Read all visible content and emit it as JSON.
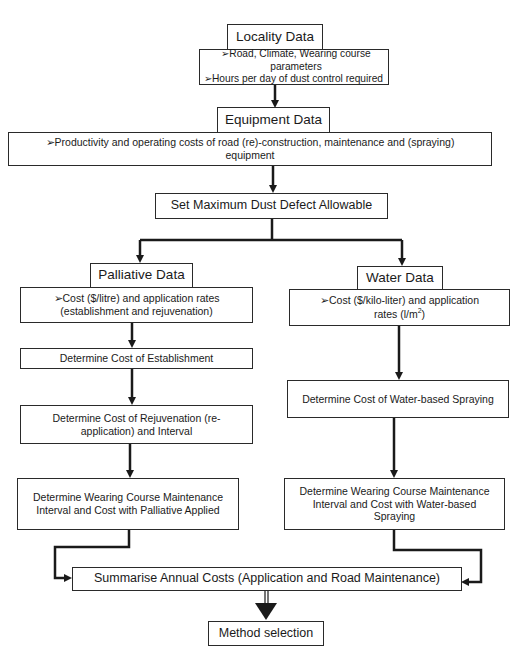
{
  "locality": {
    "title": "Locality Data",
    "items": [
      "➢Road, Climate, Wearing course parameters",
      "➢Hours per day of dust control required"
    ]
  },
  "equipment": {
    "title": "Equipment Data",
    "item": "➢Productivity and operating costs of road (re)-construction, maintenance and (spraying) equipment"
  },
  "set_max": {
    "label": "Set Maximum Dust Defect Allowable"
  },
  "palliative": {
    "title": "Palliative Data",
    "item": "➢Cost ($/litre) and application rates (establishment and rejuvenation)",
    "establishment": "Determine Cost of Establishment",
    "rejuvenation": "Determine Cost of Rejuvenation (re-application) and Interval",
    "maintenance": "Determine Wearing Course Maintenance Interval and Cost with Palliative Applied"
  },
  "water": {
    "title": "Water Data",
    "item_prefix": "➢Cost ($/kilo-liter) and  application rates (l/m",
    "item_sup": "2",
    "item_suffix": ")",
    "spraying": "Determine Cost of Water-based Spraying",
    "maintenance": "Determine Wearing Course Maintenance Interval and Cost with Water-based Spraying"
  },
  "summary": {
    "label": "Summarise Annual Costs (Application and Road Maintenance)"
  },
  "method": {
    "label": "Method selection"
  }
}
